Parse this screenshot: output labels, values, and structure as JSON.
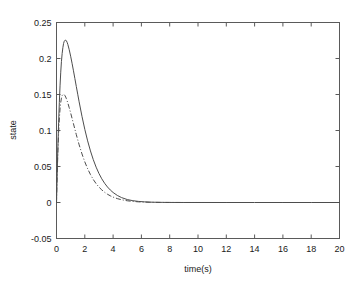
{
  "chart_data": {
    "type": "line",
    "title": "",
    "xlabel": "time(s)",
    "ylabel": "state",
    "xlim": [
      0,
      20
    ],
    "ylim": [
      -0.05,
      0.25
    ],
    "xticks": [
      0,
      2,
      4,
      6,
      8,
      10,
      12,
      14,
      16,
      18,
      20
    ],
    "xtick_labels": [
      "0",
      "2",
      "4",
      "6",
      "8",
      "10",
      "12",
      "14",
      "16",
      "18",
      "20"
    ],
    "yticks": [
      -0.05,
      0,
      0.05,
      0.1,
      0.15,
      0.2,
      0.25
    ],
    "ytick_labels": [
      "-0.05",
      "0",
      "0.05",
      "0.1",
      "0.15",
      "0.2",
      "0.25"
    ],
    "grid": false,
    "legend": "none",
    "box": true,
    "series": [
      {
        "name": "state-1",
        "style": "solid",
        "color": "#4d4d4d",
        "peak_x": 0.65,
        "peak_y": 0.225,
        "x": [
          0,
          0.05,
          0.1,
          0.15,
          0.2,
          0.25,
          0.3,
          0.35,
          0.4,
          0.45,
          0.5,
          0.55,
          0.6,
          0.65,
          0.7,
          0.75,
          0.8,
          0.9,
          1.0,
          1.1,
          1.2,
          1.3,
          1.4,
          1.5,
          1.6,
          1.8,
          2.0,
          2.2,
          2.4,
          2.6,
          2.8,
          3.0,
          3.2,
          3.4,
          3.6,
          3.8,
          4.0,
          4.3,
          4.6,
          5.0,
          5.4,
          5.8,
          6.2,
          6.6,
          7.0,
          7.5,
          8.0,
          9.0,
          10.0,
          12.0,
          14.0,
          16.0,
          18.0,
          20.0
        ],
        "y": [
          0,
          0.042,
          0.079,
          0.111,
          0.139,
          0.162,
          0.181,
          0.196,
          0.207,
          0.215,
          0.221,
          0.224,
          0.2253,
          0.2255,
          0.2245,
          0.2225,
          0.2196,
          0.2122,
          0.2032,
          0.1934,
          0.1829,
          0.1721,
          0.1612,
          0.1504,
          0.1398,
          0.1197,
          0.1016,
          0.0856,
          0.0716,
          0.0595,
          0.0491,
          0.0403,
          0.0329,
          0.0267,
          0.0216,
          0.0174,
          0.0139,
          0.0098,
          0.0068,
          0.0041,
          0.0025,
          0.0015,
          0.0009,
          0.0005,
          0.0003,
          0.00015,
          8e-05,
          2e-05,
          1e-05,
          0,
          0,
          0,
          0,
          0
        ]
      },
      {
        "name": "state-2",
        "style": "dashdot",
        "color": "#4d4d4d",
        "peak_x": 0.55,
        "peak_y": 0.15,
        "x": [
          0,
          0.05,
          0.1,
          0.15,
          0.2,
          0.25,
          0.3,
          0.35,
          0.4,
          0.45,
          0.5,
          0.55,
          0.6,
          0.65,
          0.7,
          0.8,
          0.9,
          1.0,
          1.1,
          1.2,
          1.3,
          1.4,
          1.5,
          1.6,
          1.8,
          2.0,
          2.2,
          2.4,
          2.6,
          2.8,
          3.0,
          3.2,
          3.4,
          3.6,
          3.8,
          4.0,
          4.3,
          4.6,
          5.0,
          5.4,
          5.8,
          6.2,
          6.6,
          7.0,
          7.5,
          8.0,
          9.0,
          10.0,
          12.0,
          14.0,
          16.0,
          18.0,
          20.0
        ],
        "y": [
          0,
          0.04,
          0.072,
          0.097,
          0.116,
          0.13,
          0.139,
          0.145,
          0.1485,
          0.15,
          0.1503,
          0.1497,
          0.1484,
          0.1465,
          0.1441,
          0.1383,
          0.1316,
          0.1244,
          0.1169,
          0.1093,
          0.1017,
          0.0943,
          0.0871,
          0.0802,
          0.0675,
          0.0564,
          0.0469,
          0.0388,
          0.0319,
          0.0262,
          0.0214,
          0.0175,
          0.0142,
          0.0115,
          0.0093,
          0.0075,
          0.0054,
          0.0038,
          0.0024,
          0.0015,
          0.0009,
          0.00055,
          0.00033,
          0.0002,
          0.0001,
          5e-05,
          1e-05,
          0,
          0,
          0,
          0,
          0,
          0
        ]
      }
    ]
  },
  "axes": {
    "ylabel_text": "state",
    "xlabel_text": "time(s)"
  }
}
